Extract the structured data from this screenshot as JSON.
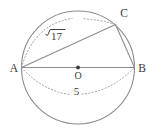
{
  "figure": {
    "background_color": "#ffffff",
    "stroke_color": "#8a8a8a",
    "dotted_color": "#9a9a9a",
    "text_color": "#3a3a3a",
    "points": {
      "a_label": "A",
      "b_label": "B",
      "c_label": "C",
      "o_label": "O"
    },
    "measures": {
      "arc_ac_label": "√17",
      "arc_ac_radicand": "17",
      "arc_ac_radical_sign": "√",
      "diameter_label": "5"
    },
    "geometry": {
      "center_x": 78,
      "center_y": 67,
      "radius": 58,
      "point_a_x": 22,
      "point_a_y": 67,
      "point_b_x": 134,
      "point_b_y": 67,
      "point_c_x": 116,
      "point_c_y": 24
    }
  }
}
